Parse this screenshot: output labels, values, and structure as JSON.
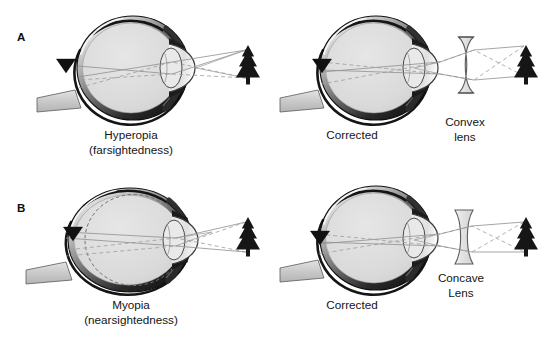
{
  "figure": {
    "background_color": "#ffffff",
    "panels": [
      {
        "letter": "A",
        "condition_label_line1": "Hyperopia",
        "condition_label_line2": "(farsightedness)",
        "corrected_label": "Corrected",
        "lens_label_line1": "Convex",
        "lens_label_line2": "lens",
        "lens_type": "biconvex",
        "focal_point": "behind retina",
        "object": "tree"
      },
      {
        "letter": "B",
        "condition_label_line1": "Myopia",
        "condition_label_line2": "(nearsightedness)",
        "corrected_label": "Corrected",
        "lens_label_line1": "Concave",
        "lens_label_line2": "Lens",
        "lens_type": "biconcave",
        "focal_point": "in front of retina",
        "object": "tree"
      }
    ],
    "colors": {
      "ink": "#141414",
      "sclera_outline": "#1a1a1a",
      "vitreous_fill": "#dcdcdc",
      "optic_nerve_fill": "#c9c9c9",
      "ray_solid": "#8a8a8a",
      "ray_dashed": "#9a9a9a",
      "tree": "#161616",
      "lens_glass": "#e4e4e4"
    },
    "icon_names": {
      "eyeball": "eyeball-icon",
      "tree": "tree-icon",
      "arrow": "inverted-image-arrow-icon",
      "convex_lens": "convex-lens-icon",
      "concave_lens": "concave-lens-icon",
      "optic_nerve": "optic-nerve-icon"
    }
  }
}
